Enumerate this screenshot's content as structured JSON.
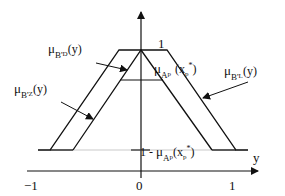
{
  "diagram": {
    "axis_labels": {
      "x": "y"
    },
    "ticks": {
      "x": [
        "−1",
        "0",
        "1"
      ],
      "y_top": "1"
    },
    "curves": {
      "B_D": {
        "mu": "μ",
        "sub": "B'",
        "subsub": "D",
        "arg": "(y)"
      },
      "B_Z": {
        "mu": "μ",
        "sub": "B'",
        "subsub": "Z",
        "arg": "(y)"
      },
      "B_L": {
        "mu": "μ",
        "sub": "B'",
        "subsub": "L",
        "arg": "(y)"
      }
    },
    "level_top": {
      "mu": "μ",
      "sub": "A",
      "subsub": "p",
      "arg": "(x",
      "argsub": "p",
      "sup": "*",
      "close": ")"
    },
    "level_bottom": {
      "prefix": "1 - ",
      "mu": "μ",
      "sub": "A",
      "subsub": "p",
      "arg": "(x",
      "argsub": "p",
      "sup": "*",
      "close": ")"
    },
    "colors": {
      "line": "#111111",
      "faint": "#bbbbbb"
    }
  }
}
